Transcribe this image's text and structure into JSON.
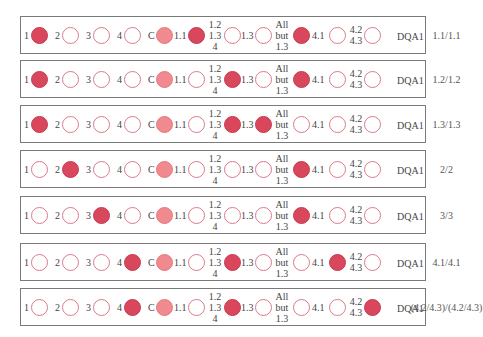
{
  "colors": {
    "filled": "#d9475c",
    "control_light": "#f08a8f",
    "empty_border": "#dc7a86",
    "box_border": "#7a7a7a"
  },
  "labels": {
    "probe_1": "1",
    "probe_2": "2",
    "probe_3": "3",
    "probe_4": "4",
    "probe_c": "C",
    "probe_1_1": "1.1",
    "probe_stack_a": [
      "1.2",
      "1.3",
      "4"
    ],
    "probe_1_3": "1.3",
    "probe_stack_b": [
      "All",
      "but",
      "1.3"
    ],
    "probe_4_1": "4.1",
    "probe_stack_c": [
      "4.2",
      "4.3"
    ],
    "locus": "DQA1"
  },
  "probe_order": [
    "1",
    "2",
    "3",
    "4",
    "C",
    "1.1",
    "1.2/1.3/4",
    "1.3",
    "All but 1.3",
    "4.1",
    "4.2/4.3"
  ],
  "rows": [
    {
      "genotype": "1.1/1.1",
      "states": [
        "filled",
        "empty",
        "empty",
        "empty",
        "light",
        "filled",
        "empty",
        "empty",
        "filled",
        "empty",
        "empty"
      ]
    },
    {
      "genotype": "1.2/1.2",
      "states": [
        "filled",
        "empty",
        "empty",
        "empty",
        "light",
        "empty",
        "filled",
        "empty",
        "filled",
        "empty",
        "empty"
      ]
    },
    {
      "genotype": "1.3/1.3",
      "states": [
        "filled",
        "empty",
        "empty",
        "empty",
        "light",
        "empty",
        "filled",
        "filled",
        "empty",
        "empty",
        "empty"
      ]
    },
    {
      "genotype": "2/2",
      "states": [
        "empty",
        "filled",
        "empty",
        "empty",
        "light",
        "empty",
        "empty",
        "empty",
        "filled",
        "empty",
        "empty"
      ]
    },
    {
      "genotype": "3/3",
      "states": [
        "empty",
        "empty",
        "filled",
        "empty",
        "light",
        "empty",
        "empty",
        "empty",
        "filled",
        "empty",
        "empty"
      ]
    },
    {
      "genotype": "4.1/4.1",
      "states": [
        "empty",
        "empty",
        "empty",
        "filled",
        "light",
        "empty",
        "filled",
        "empty",
        "empty",
        "filled",
        "empty"
      ]
    },
    {
      "genotype": "(4.2/4.3)/(4.2/4.3)",
      "states": [
        "empty",
        "empty",
        "empty",
        "filled",
        "light",
        "empty",
        "filled",
        "empty",
        "empty",
        "empty",
        "filled"
      ]
    }
  ]
}
